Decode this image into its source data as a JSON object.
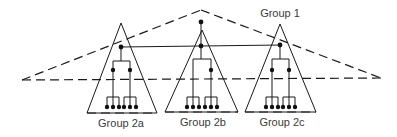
{
  "diagram": {
    "type": "hierarchical-groups",
    "colors": {
      "stroke": "#1a1a1a",
      "node": "#111111",
      "label": "#3a3a3a",
      "background": "#ffffff"
    },
    "outer_group": {
      "label": "Group 1",
      "style": "dashed-triangle"
    },
    "subgroups": [
      {
        "label": "Group 2a",
        "leaf_count": 6
      },
      {
        "label": "Group 2b",
        "leaf_count": 6
      },
      {
        "label": "Group 2c",
        "leaf_count": 6
      }
    ],
    "link": {
      "style": "solid-horizontal",
      "connects": [
        "Group 2a",
        "Group 2b",
        "Group 2c"
      ]
    }
  }
}
